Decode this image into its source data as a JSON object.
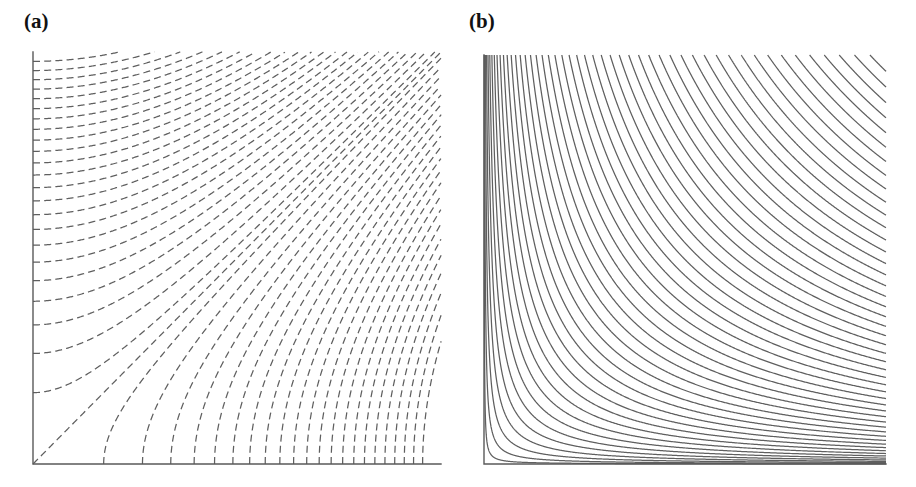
{
  "figure": {
    "background_color": "#ffffff",
    "curve_color": "#5f5f5f",
    "axis_color": "#5a5a5a",
    "label_color": "#111111"
  },
  "panels": [
    {
      "id": "a",
      "label": "(a)",
      "line_style": "dashed",
      "dash_pattern": "7 4.2",
      "frame": {
        "x0": 33,
        "y0": 464,
        "x1": 441,
        "y1": 52
      },
      "axes": {
        "left": true,
        "bottom": true,
        "top": false,
        "right": false
      },
      "chart_ref": 0
    },
    {
      "id": "b",
      "label": "(b)",
      "line_style": "solid",
      "dash_pattern": "none",
      "frame": {
        "x0": 26,
        "y0": 464,
        "x1": 428,
        "y1": 55
      },
      "axes": {
        "left": true,
        "bottom": true,
        "top": false,
        "right": false
      },
      "chart_ref": 1
    }
  ],
  "chart_data": [
    {
      "type": "line",
      "panel": "a",
      "title": "(a)",
      "family": "x^2 - y^2 = c",
      "description": "Dashed orthogonal trajectories (equipotential lines) of the hyperbolic family; curves leave the left axis horizontally, bend upward and approach 45 degrees at upper right, and rise vertically from the bottom axis. The separatrix is the diagonal y = x through the origin corner.",
      "xlabel": "",
      "ylabel": "",
      "xlim": [
        0,
        1
      ],
      "ylim": [
        0,
        1
      ],
      "grid": false,
      "legend": "none",
      "n_curves": 46,
      "c_values": [
        -0.955,
        -0.912,
        -0.87,
        -0.828,
        -0.786,
        -0.744,
        -0.702,
        -0.66,
        -0.618,
        -0.576,
        -0.534,
        -0.492,
        -0.45,
        -0.408,
        -0.366,
        -0.324,
        -0.282,
        -0.24,
        -0.198,
        -0.156,
        -0.114,
        -0.072,
        -0.03,
        0,
        0.03,
        0.072,
        0.114,
        0.156,
        0.198,
        0.24,
        0.282,
        0.324,
        0.366,
        0.408,
        0.45,
        0.492,
        0.534,
        0.576,
        0.618,
        0.66,
        0.702,
        0.744,
        0.786,
        0.828,
        0.87,
        0.912
      ],
      "left_axis_intercepts": [
        0.0,
        0.173,
        0.245,
        0.3,
        0.346,
        0.387,
        0.424,
        0.458,
        0.49,
        0.52,
        0.548,
        0.574,
        0.6,
        0.624,
        0.648,
        0.67,
        0.692,
        0.714,
        0.735,
        0.755,
        0.775,
        0.794,
        0.812,
        0.83,
        0.848,
        0.866,
        0.883,
        0.9,
        0.917,
        0.933,
        0.949,
        0.964,
        0.98
      ],
      "bottom_axis_intercepts": [
        0.173,
        0.245,
        0.3,
        0.346,
        0.387,
        0.424,
        0.458,
        0.49,
        0.52,
        0.548,
        0.574,
        0.6,
        0.624,
        0.648,
        0.67,
        0.692,
        0.714,
        0.735,
        0.755,
        0.775,
        0.794,
        0.812,
        0.83,
        0.848,
        0.866,
        0.883,
        0.9,
        0.917,
        0.933,
        0.949,
        0.964,
        0.98
      ]
    },
    {
      "type": "line",
      "panel": "b",
      "title": "(b)",
      "family": "x*y = k",
      "description": "Solid rectangular hyperbolas (streamlines) asymptotic to both axes; curves enter through the top edge, bend around the lower-left corner region and exit through the right edge. Spacing is dense near the corner and widens outward.",
      "xlabel": "",
      "ylabel": "",
      "xlim": [
        0,
        1
      ],
      "ylim": [
        0,
        1
      ],
      "grid": false,
      "legend": "none",
      "n_curves": 58,
      "k_values": [
        0.0004,
        0.0016,
        0.0036,
        0.0064,
        0.01,
        0.0144,
        0.0196,
        0.0256,
        0.0324,
        0.04,
        0.0484,
        0.0576,
        0.0676,
        0.0784,
        0.09,
        0.1024,
        0.1156,
        0.1296,
        0.1444,
        0.16,
        0.1764,
        0.1936,
        0.2116,
        0.2304,
        0.25,
        0.2704,
        0.2916,
        0.3136,
        0.3364,
        0.36,
        0.3844,
        0.4096,
        0.4356,
        0.4624,
        0.49,
        0.5184,
        0.5476,
        0.5776,
        0.6084,
        0.64,
        0.6724,
        0.7056,
        0.7396,
        0.7744,
        0.81,
        0.8464,
        0.8836,
        0.9216,
        0.96
      ],
      "top_edge_entries": [
        0.0004,
        0.0016,
        0.0036,
        0.0064,
        0.01,
        0.0144,
        0.0196,
        0.0256,
        0.0324,
        0.04,
        0.0484,
        0.0576,
        0.0676,
        0.0784,
        0.09,
        0.1024,
        0.1156,
        0.1296,
        0.1444,
        0.16,
        0.1764,
        0.1936,
        0.2116,
        0.2304,
        0.25,
        0.2704,
        0.2916,
        0.3136,
        0.3364,
        0.36,
        0.3844,
        0.4096,
        0.4356,
        0.4624,
        0.49,
        0.5184,
        0.5476,
        0.5776,
        0.6084,
        0.64,
        0.6724,
        0.7056,
        0.7396,
        0.7744,
        0.81,
        0.8464,
        0.8836,
        0.9216,
        0.96
      ],
      "right_edge_exits": [
        0.0004,
        0.0016,
        0.0036,
        0.0064,
        0.01,
        0.0144,
        0.0196,
        0.0256,
        0.0324,
        0.04,
        0.0484,
        0.0576,
        0.0676,
        0.0784,
        0.09,
        0.1024,
        0.1156,
        0.1296,
        0.1444,
        0.16,
        0.1764,
        0.1936,
        0.2116,
        0.2304,
        0.25,
        0.2704,
        0.2916,
        0.3136,
        0.3364,
        0.36,
        0.3844,
        0.4096,
        0.4356,
        0.4624,
        0.49,
        0.5184,
        0.5476,
        0.5776,
        0.6084,
        0.64,
        0.6724,
        0.7056,
        0.7396,
        0.7744,
        0.81,
        0.8464,
        0.8836,
        0.9216,
        0.96
      ]
    }
  ]
}
